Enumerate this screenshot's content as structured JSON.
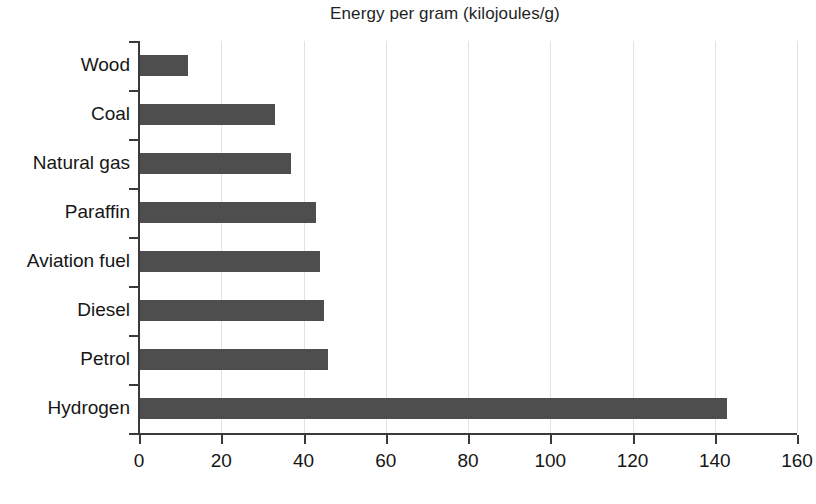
{
  "chart_data": {
    "type": "bar",
    "orientation": "horizontal",
    "title": "Energy per gram (kilojoules/g)",
    "xlabel": "",
    "ylabel": "",
    "categories": [
      "Wood",
      "Coal",
      "Natural gas",
      "Paraffin",
      "Aviation fuel",
      "Diesel",
      "Petrol",
      "Hydrogen"
    ],
    "values": [
      12,
      33,
      37,
      43,
      44,
      45,
      46,
      143
    ],
    "xlim": [
      0,
      160
    ],
    "xticks": [
      0,
      20,
      40,
      60,
      80,
      100,
      120,
      140,
      160
    ],
    "xtick_labels": [
      "0",
      "20",
      "40",
      "60",
      "80",
      "100",
      "120",
      "140",
      "160"
    ],
    "grid": "vertical",
    "legend": "none",
    "bar_color": "#4e4e4e",
    "gridline_color": "#e3e3e3",
    "axis_color": "#3a3a3a",
    "background_color": "#ffffff"
  }
}
